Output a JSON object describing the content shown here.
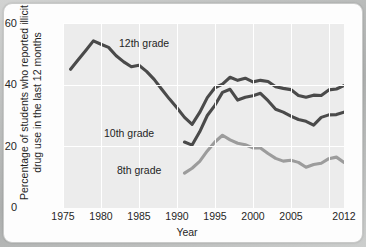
{
  "chart_data": {
    "type": "line",
    "title": "",
    "xlabel": "Year",
    "ylabel": "Percentage of students who reported illicit drug use in the last 12 months",
    "xlim": [
      1975,
      2012
    ],
    "ylim": [
      0,
      60
    ],
    "xticks": [
      "1975",
      "1980",
      "1985",
      "1990",
      "1995",
      "2000",
      "2005",
      "2012"
    ],
    "xtick_values": [
      1975,
      1980,
      1985,
      1990,
      1995,
      2000,
      2005,
      2012
    ],
    "yticks": [
      "0",
      "20",
      "40",
      "60"
    ],
    "ytick_values": [
      0,
      20,
      40,
      60
    ],
    "grid": true,
    "legend_position": "inline-annotations",
    "series": [
      {
        "name": "12th grade",
        "color": "#4a4a4a",
        "x": [
          1976,
          1977,
          1978,
          1979,
          1980,
          1981,
          1982,
          1983,
          1984,
          1985,
          1986,
          1987,
          1988,
          1989,
          1990,
          1991,
          1992,
          1993,
          1994,
          1995,
          1996,
          1997,
          1998,
          1999,
          2000,
          2001,
          2002,
          2003,
          2004,
          2005,
          2006,
          2007,
          2008,
          2009,
          2010,
          2011,
          2012
        ],
        "values": [
          45.0,
          48.1,
          51.1,
          54.2,
          53.1,
          52.1,
          49.4,
          47.4,
          45.8,
          46.3,
          44.3,
          41.7,
          38.5,
          35.4,
          32.5,
          29.4,
          27.1,
          31.0,
          35.8,
          39.0,
          40.2,
          42.4,
          41.4,
          42.1,
          40.9,
          41.4,
          41.0,
          39.3,
          38.8,
          38.4,
          36.5,
          35.9,
          36.6,
          36.5,
          38.3,
          38.6,
          39.7
        ]
      },
      {
        "name": "10th grade",
        "color": "#4a4a4a",
        "x": [
          1991,
          1992,
          1993,
          1994,
          1995,
          1996,
          1997,
          1998,
          1999,
          2000,
          2001,
          2002,
          2003,
          2004,
          2005,
          2006,
          2007,
          2008,
          2009,
          2010,
          2011,
          2012
        ],
        "values": [
          21.4,
          20.4,
          24.7,
          30.0,
          33.3,
          37.5,
          38.5,
          35.0,
          35.9,
          36.4,
          37.2,
          34.8,
          32.0,
          31.1,
          29.8,
          28.7,
          28.1,
          26.9,
          29.4,
          30.2,
          30.3,
          31.1
        ]
      },
      {
        "name": "8th grade",
        "color": "#9c9c9c",
        "x": [
          1991,
          1992,
          1993,
          1994,
          1995,
          1996,
          1997,
          1998,
          1999,
          2000,
          2001,
          2002,
          2003,
          2004,
          2005,
          2006,
          2007,
          2008,
          2009,
          2010,
          2011,
          2012
        ],
        "values": [
          11.3,
          12.9,
          15.1,
          18.5,
          21.4,
          23.6,
          22.1,
          21.0,
          20.5,
          19.5,
          19.5,
          17.7,
          16.1,
          15.2,
          15.5,
          14.8,
          13.2,
          14.1,
          14.5,
          16.0,
          16.5,
          14.8
        ]
      }
    ],
    "annotations": [
      {
        "label": "12th grade"
      },
      {
        "label": "10th grade"
      },
      {
        "label": "8th grade"
      }
    ]
  }
}
